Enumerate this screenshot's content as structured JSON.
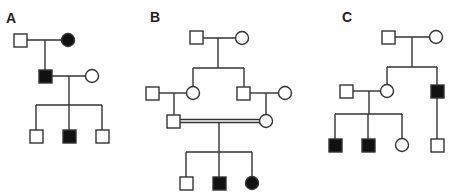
{
  "figure": {
    "stroke_color": "#333333",
    "fill_affected": "#111111",
    "fill_unaffected": "#ffffff",
    "panels": [
      {
        "label": "A",
        "individuals": [
          {
            "id": "A-I-1",
            "sex": "male",
            "affected": false,
            "generation": 1
          },
          {
            "id": "A-I-2",
            "sex": "female",
            "affected": true,
            "generation": 1
          },
          {
            "id": "A-II-1",
            "sex": "male",
            "affected": true,
            "generation": 2
          },
          {
            "id": "A-II-2",
            "sex": "female",
            "affected": false,
            "generation": 2
          },
          {
            "id": "A-III-1",
            "sex": "male",
            "affected": false,
            "generation": 3
          },
          {
            "id": "A-III-2",
            "sex": "male",
            "affected": true,
            "generation": 3
          },
          {
            "id": "A-III-3",
            "sex": "male",
            "affected": false,
            "generation": 3
          }
        ]
      },
      {
        "label": "B",
        "consanguineous": true,
        "individuals": [
          {
            "id": "B-I-1",
            "sex": "male",
            "affected": false,
            "generation": 1
          },
          {
            "id": "B-I-2",
            "sex": "female",
            "affected": false,
            "generation": 1
          },
          {
            "id": "B-II-1",
            "sex": "male",
            "affected": false,
            "generation": 2
          },
          {
            "id": "B-II-2",
            "sex": "female",
            "affected": false,
            "generation": 2
          },
          {
            "id": "B-II-3",
            "sex": "male",
            "affected": false,
            "generation": 2
          },
          {
            "id": "B-II-4",
            "sex": "female",
            "affected": false,
            "generation": 2
          },
          {
            "id": "B-III-1",
            "sex": "male",
            "affected": false,
            "generation": 3
          },
          {
            "id": "B-III-2",
            "sex": "female",
            "affected": false,
            "generation": 3
          },
          {
            "id": "B-IV-1",
            "sex": "male",
            "affected": false,
            "generation": 4
          },
          {
            "id": "B-IV-2",
            "sex": "male",
            "affected": true,
            "generation": 4
          },
          {
            "id": "B-IV-3",
            "sex": "female",
            "affected": true,
            "generation": 4
          }
        ]
      },
      {
        "label": "C",
        "individuals": [
          {
            "id": "C-I-1",
            "sex": "male",
            "affected": false,
            "generation": 1
          },
          {
            "id": "C-I-2",
            "sex": "female",
            "affected": false,
            "generation": 1
          },
          {
            "id": "C-II-1",
            "sex": "male",
            "affected": false,
            "generation": 2
          },
          {
            "id": "C-II-2",
            "sex": "female",
            "affected": false,
            "generation": 2
          },
          {
            "id": "C-II-3",
            "sex": "male",
            "affected": true,
            "generation": 2
          },
          {
            "id": "C-III-1",
            "sex": "male",
            "affected": true,
            "generation": 3
          },
          {
            "id": "C-III-2",
            "sex": "male",
            "affected": true,
            "generation": 3
          },
          {
            "id": "C-III-3",
            "sex": "female",
            "affected": false,
            "generation": 3
          },
          {
            "id": "C-III-4",
            "sex": "male",
            "affected": false,
            "generation": 3
          }
        ]
      }
    ]
  }
}
